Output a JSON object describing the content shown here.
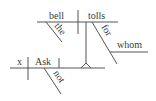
{
  "diagram": {
    "type": "sentence-diagram",
    "sentence": "Ask not for whom the bell tolls",
    "top_clause": {
      "subject": "bell",
      "verb": "tolls",
      "subject_modifier": "the",
      "preposition": "for",
      "prep_object": "whom"
    },
    "main_clause": {
      "subject": "x",
      "verb": "Ask",
      "verb_modifier": "not"
    },
    "line_color": "#555555",
    "text_color": "#3a3a3a"
  }
}
